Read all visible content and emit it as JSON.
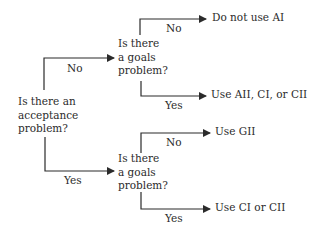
{
  "diagram": {
    "type": "decision-tree",
    "root": {
      "question": "Is there an\nacceptance\nproblem?"
    },
    "upper_node": {
      "edge_label": "No",
      "question": "Is there\na goals\nproblem?",
      "no_label": "No",
      "no_outcome": "Do not use AI",
      "yes_label": "Yes",
      "yes_outcome": "Use AII, CI, or CII"
    },
    "lower_node": {
      "edge_label": "Yes",
      "question": "Is there\na goals\nproblem?",
      "no_label": "No",
      "no_outcome": "Use GII",
      "yes_label": "Yes",
      "yes_outcome": "Use CI or CII"
    },
    "colors": {
      "line": "#2b2b2b",
      "background": "#ffffff"
    }
  }
}
